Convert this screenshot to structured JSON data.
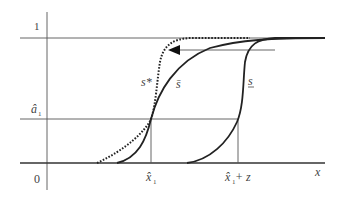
{
  "diagram": {
    "y_axis_labels": {
      "one": "1",
      "a_hat": "â",
      "a_hat_sub": "1",
      "zero": "0"
    },
    "x_axis_labels": {
      "x_hat": "x̂",
      "x_hat_sub": "1",
      "x_hat_plus_z_base": "x̂",
      "x_hat_plus_z_sub": "1",
      "x_hat_plus_z_suffix": " + z",
      "x": "x"
    },
    "curve_labels": {
      "s_star": "s*",
      "s_bar": "s̄",
      "s_underline": "s"
    },
    "arrow": {
      "direction": "left"
    }
  }
}
